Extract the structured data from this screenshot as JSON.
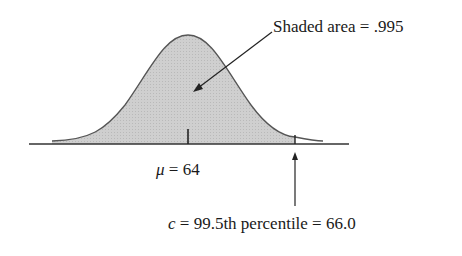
{
  "diagram": {
    "type": "normal-distribution-shaded",
    "annotations": {
      "shaded_area_label": "Shaded area = .995",
      "mean_symbol": "μ",
      "mean_rest": " = 64",
      "c_symbol": "c",
      "c_rest": " = 99.5th percentile = 66.0"
    },
    "values": {
      "mean": 64,
      "shaded_area": 0.995,
      "percentile": "99.5th",
      "cutoff": 66.0
    },
    "colors": {
      "fill": "#c8c8c8",
      "curve": "#555555",
      "axis": "#333333",
      "text": "#1a1a1a"
    }
  }
}
